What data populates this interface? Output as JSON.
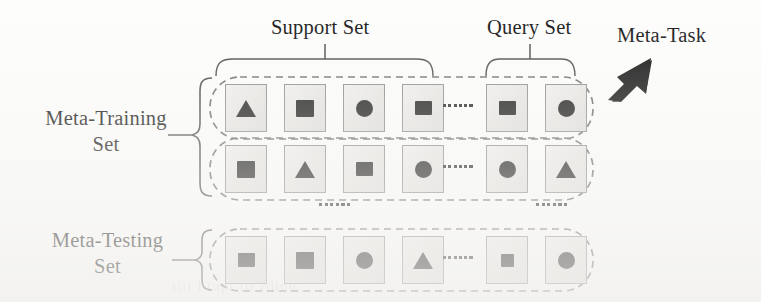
{
  "figure": {
    "title_labels": {
      "support_set": "Support Set",
      "query_set": "Query Set",
      "meta_task": "Meta-Task"
    },
    "side_labels": {
      "meta_training_line1": "Meta-Training",
      "meta_training_line2": "Set",
      "meta_testing_line1": "Meta-Testing",
      "meta_testing_line2": "Set"
    },
    "ghost_artifact": "tlit l tnpt     lif rdlnu"
  },
  "colors": {
    "page_background": "#fdfdfc",
    "cell_fill": "#e9e8e5",
    "cell_border": "#8d8d8d",
    "glyph_fill": "#1d1d1d",
    "capsule_dash": "#6f6f6f",
    "bracket_stroke": "#4a4a4a",
    "arrow_fill": "#121212",
    "text": "#151515"
  },
  "rows": [
    {
      "id": "row-train-1",
      "group": "meta-training",
      "support": [
        {
          "shape": "triangle",
          "icon": "triangle-icon"
        },
        {
          "shape": "square-big",
          "icon": "square-icon"
        },
        {
          "shape": "circle",
          "icon": "circle-icon"
        },
        {
          "shape": "square",
          "icon": "square-icon"
        }
      ],
      "ellipsis_dots": 6,
      "query": [
        {
          "shape": "square",
          "icon": "square-icon"
        },
        {
          "shape": "circle",
          "icon": "circle-icon"
        }
      ]
    },
    {
      "id": "row-train-2",
      "group": "meta-training",
      "support": [
        {
          "shape": "square-big",
          "icon": "square-icon"
        },
        {
          "shape": "triangle",
          "icon": "triangle-icon"
        },
        {
          "shape": "square",
          "icon": "square-icon"
        },
        {
          "shape": "circle",
          "icon": "circle-icon"
        }
      ],
      "ellipsis_dots": 6,
      "query": [
        {
          "shape": "circle",
          "icon": "circle-icon"
        },
        {
          "shape": "triangle",
          "icon": "triangle-icon"
        }
      ]
    },
    {
      "id": "row-test-1",
      "group": "meta-testing",
      "support": [
        {
          "shape": "square",
          "icon": "square-icon"
        },
        {
          "shape": "square-big",
          "icon": "square-icon"
        },
        {
          "shape": "circle",
          "icon": "circle-icon"
        },
        {
          "shape": "triangle",
          "icon": "triangle-icon"
        }
      ],
      "ellipsis_dots": 6,
      "query": [
        {
          "shape": "square-small",
          "icon": "square-icon"
        },
        {
          "shape": "circle",
          "icon": "circle-icon"
        }
      ]
    }
  ],
  "gap_ellipsis": {
    "left_dots": 6,
    "right_dots": 6
  }
}
